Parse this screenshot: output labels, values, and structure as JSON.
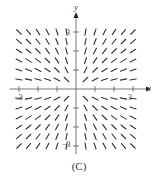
{
  "figure": {
    "caption": "(C)",
    "x_axis_label": "x",
    "y_axis_label": "y",
    "tick_labels": {
      "x_neg": "−3",
      "x_pos": "3",
      "y_pos": "3",
      "y_neg": "−3"
    }
  },
  "chart_data": {
    "type": "slope_field",
    "title": "(C)",
    "xlabel": "x",
    "ylabel": "y",
    "xlim": [
      -3,
      3
    ],
    "ylim": [
      -3,
      3
    ],
    "ticks": [
      -3,
      -2,
      -1,
      1,
      2,
      3
    ],
    "grid_x": [
      -3,
      -2.5,
      -2,
      -1.5,
      -1,
      -0.5,
      0.5,
      1,
      1.5,
      2,
      2.5,
      3
    ],
    "grid_y": [
      -3,
      -2.5,
      -2,
      -1.5,
      -1,
      -0.5,
      0.5,
      1,
      1.5,
      2,
      2.5,
      3
    ],
    "slope_pattern": "y/x",
    "colors": {
      "segment": "#333333",
      "axis": "#555555"
    }
  }
}
